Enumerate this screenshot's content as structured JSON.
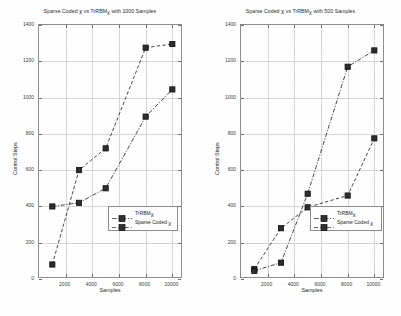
{
  "figure": {
    "background_color": "#ffffff",
    "axis_color": "#8d8d8d",
    "grid_color": "#d7d7d7",
    "series_color": "#262626"
  },
  "left_chart": {
    "title_prefix": "Sparse Coded ",
    "title_chi1": "χ",
    "title_mid": " vs TrRBM",
    "title_chi2": "χ",
    "title_suffix": " with 1000 Samples",
    "title_full": "Sparse Coded χ vs TrRBMχ with 1000 Samples",
    "xlabel": "Samples",
    "ylabel": "Control Steps",
    "ytick_labels": [
      "0",
      "200",
      "400",
      "600",
      "800",
      "1000",
      "1200",
      "1400"
    ],
    "xtick_labels": [
      "2000",
      "4000",
      "6000",
      "8000",
      "10000"
    ],
    "legend": {
      "item1_prefix": "TrRBM",
      "item1_chi": "χ",
      "item1_full": "TrRBMχ",
      "item2_prefix": "Sparse Coded ",
      "item2_chi": "χ",
      "item2_full": "Sparse Coded χ"
    }
  },
  "right_chart": {
    "title_prefix": "Sparse Coded ",
    "title_chi1": "χ",
    "title_mid": " vs TrRBM",
    "title_chi2": "χ",
    "title_suffix": " with 500 Samples",
    "title_full": "Sparse Coded χ vs TrRBMχ with 500 Samples",
    "xlabel": "Samples",
    "ylabel": "Control Steps",
    "ytick_labels": [
      "0",
      "200",
      "400",
      "600",
      "800",
      "1000",
      "1200",
      "1400"
    ],
    "xtick_labels": [
      "2000",
      "4000",
      "6000",
      "8000",
      "10000"
    ],
    "legend": {
      "item1_prefix": "TrRBM",
      "item1_chi": "χ",
      "item1_full": "TrRBMχ",
      "item2_prefix": "Sparse Coded ",
      "item2_chi": "χ",
      "item2_full": "Sparse Coded χ"
    }
  },
  "chart_data": [
    {
      "type": "line",
      "title": "Sparse Coded χ vs TrRBMχ with 1000 Samples",
      "xlabel": "Samples",
      "ylabel": "Control Steps",
      "xlim": [
        0,
        10800
      ],
      "ylim": [
        0,
        1400
      ],
      "xticks": [
        2000,
        4000,
        6000,
        8000,
        10000
      ],
      "yticks": [
        0,
        200,
        400,
        600,
        800,
        1000,
        1200,
        1400
      ],
      "grid": true,
      "legend_position": "center-right",
      "x": [
        1000,
        3000,
        5000,
        8000,
        10000
      ],
      "series": [
        {
          "name": "TrRBMχ",
          "linestyle": "dashdot",
          "marker": "filled-square",
          "values": [
            400,
            420,
            500,
            895,
            1045
          ]
        },
        {
          "name": "Sparse Coded χ",
          "linestyle": "dashed",
          "marker": "filled-square",
          "values": [
            80,
            600,
            720,
            1275,
            1295
          ]
        }
      ]
    },
    {
      "type": "line",
      "title": "Sparse Coded χ vs TrRBMχ with 500 Samples",
      "xlabel": "Samples",
      "ylabel": "Control Steps",
      "xlim": [
        0,
        10800
      ],
      "ylim": [
        0,
        1400
      ],
      "xticks": [
        2000,
        4000,
        6000,
        8000,
        10000
      ],
      "yticks": [
        0,
        200,
        400,
        600,
        800,
        1000,
        1200,
        1400
      ],
      "grid": true,
      "legend_position": "center-right",
      "x": [
        1000,
        3000,
        5000,
        8000,
        10000
      ],
      "series": [
        {
          "name": "TrRBMχ",
          "linestyle": "dashed",
          "marker": "filled-square",
          "values": [
            55,
            280,
            395,
            460,
            775
          ]
        },
        {
          "name": "Sparse Coded χ",
          "linestyle": "dashdot",
          "marker": "filled-square",
          "values": [
            45,
            90,
            470,
            1170,
            1260
          ]
        }
      ]
    }
  ]
}
